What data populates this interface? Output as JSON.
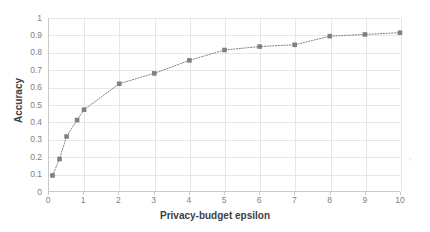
{
  "chart_data": {
    "type": "line",
    "title": "",
    "xlabel": "Privacy-budget epsilon",
    "ylabel": "Accuracy",
    "xlim": [
      0,
      10
    ],
    "ylim": [
      0,
      1
    ],
    "grid": true,
    "legend": "none",
    "marker": "square",
    "linestyle": "dotted",
    "series_color": "#808080",
    "x": [
      0.1,
      0.3,
      0.5,
      0.8,
      1,
      2,
      3,
      4,
      5,
      6,
      7,
      8,
      9,
      10
    ],
    "values": [
      0.09,
      0.185,
      0.315,
      0.41,
      0.47,
      0.62,
      0.68,
      0.755,
      0.815,
      0.835,
      0.845,
      0.895,
      0.905,
      0.915
    ],
    "series": [
      {
        "name": "Accuracy",
        "x": [
          0.1,
          0.3,
          0.5,
          0.8,
          1,
          2,
          3,
          4,
          5,
          6,
          7,
          8,
          9,
          10
        ],
        "values": [
          0.09,
          0.185,
          0.315,
          0.41,
          0.47,
          0.62,
          0.68,
          0.755,
          0.815,
          0.835,
          0.845,
          0.895,
          0.905,
          0.915
        ]
      }
    ],
    "yticks": [
      0,
      0.1,
      0.2,
      0.3,
      0.4,
      0.5,
      0.6,
      0.7,
      0.8,
      0.9,
      1
    ],
    "ytick_labels": [
      "0",
      "0.1",
      "0.2",
      "0.3",
      "0.4",
      "0.5",
      "0.6",
      "0.7",
      "0.8",
      "0.9",
      "1"
    ],
    "xticks": [
      0,
      1,
      2,
      3,
      4,
      5,
      6,
      7,
      8,
      9,
      10
    ],
    "xtick_labels": [
      "0",
      "1",
      "2",
      "3",
      "4",
      "5",
      "6",
      "7",
      "8",
      "9",
      "10"
    ]
  },
  "colors": {
    "series": "#808080",
    "grid": "#e6e6e6",
    "axis": "#c9c9c9",
    "tick_text": "#7f7f7f",
    "title_text": "#404040",
    "background": "#ffffff"
  }
}
